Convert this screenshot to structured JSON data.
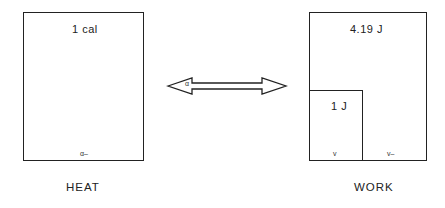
{
  "diagram": {
    "heat_box": {
      "value_label": "1 cal",
      "bottom_mark": "α–",
      "caption": "HEAT"
    },
    "work_box": {
      "value_label": "4.19 J",
      "inner_box": {
        "value_label": "1 J",
        "bottom_mark": "v"
      },
      "bottom_mark": "v–",
      "caption": "WORK"
    },
    "arrow": {
      "type": "double-headed",
      "mark": "α"
    },
    "colors": {
      "line": "#222222",
      "background": "#ffffff"
    }
  }
}
